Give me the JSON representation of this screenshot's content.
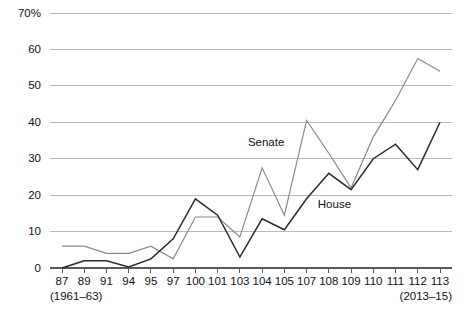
{
  "chart_data": {
    "type": "line",
    "title": "",
    "subtitle": "",
    "xlabel": "",
    "ylabel": "",
    "grid": true,
    "legend_position": "inline-annotation",
    "ylim": [
      0,
      70
    ],
    "yticks": [
      0,
      10,
      20,
      30,
      40,
      50,
      60,
      70
    ],
    "ytick_labels": [
      "0",
      "10",
      "20",
      "30",
      "40",
      "50",
      "60",
      "70%"
    ],
    "categories": [
      "87",
      "89",
      "91",
      "94",
      "95",
      "97",
      "100",
      "101",
      "103",
      "104",
      "105",
      "107",
      "108",
      "109",
      "110",
      "111",
      "112",
      "113"
    ],
    "x_range_start_label": "(1961–63)",
    "x_range_end_label": "(2013–15)",
    "series": [
      {
        "name": "Senate",
        "color": "#8a8a8a",
        "values": [
          6.0,
          6.0,
          4.0,
          4.0,
          6.0,
          2.5,
          14.0,
          14.0,
          8.5,
          27.5,
          14.5,
          40.5,
          31.5,
          22.0,
          36.0,
          46.0,
          57.5,
          54.0
        ]
      },
      {
        "name": "House",
        "color": "#2b2b2b",
        "values": [
          0.0,
          2.0,
          2.0,
          0.3,
          2.5,
          8.0,
          19.0,
          14.5,
          3.0,
          13.5,
          10.5,
          19.0,
          26.0,
          21.5,
          30.0,
          34.0,
          27.0,
          40.0
        ]
      }
    ],
    "annotations": [
      {
        "text": "Senate",
        "x_index": 10,
        "value": 33.5
      },
      {
        "text": "House",
        "x_index": 13,
        "value": 16.5
      }
    ]
  }
}
